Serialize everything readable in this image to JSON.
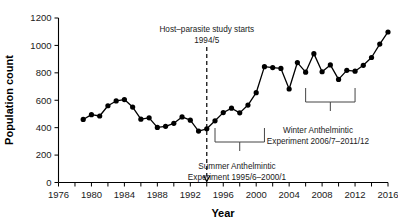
{
  "chart_data": {
    "type": "line",
    "title": "",
    "xlabel": "Year",
    "ylabel": "Population count",
    "xlim": [
      1976,
      2016
    ],
    "ylim": [
      0,
      1200
    ],
    "grid": false,
    "legend": "none",
    "xticks": [
      "1976",
      "1980",
      "1984",
      "1988",
      "1992",
      "1996",
      "2000",
      "2004",
      "2008",
      "2012",
      "2016"
    ],
    "yticks": [
      "0",
      "200",
      "400",
      "600",
      "800",
      "1000",
      "1200"
    ],
    "series": [
      {
        "name": "Population count",
        "marker": "filled-circle",
        "color": "#000000",
        "x": [
          1979,
          1980,
          1981,
          1982,
          1983,
          1984,
          1985,
          1986,
          1987,
          1988,
          1989,
          1990,
          1991,
          1992,
          1993,
          1994,
          1995,
          1996,
          1997,
          1998,
          1999,
          2000,
          2001,
          2002,
          2003,
          2004,
          2005,
          2006,
          2007,
          2008,
          2009,
          2010,
          2011,
          2012,
          2013,
          2014,
          2015,
          2016
        ],
        "values": [
          460,
          495,
          485,
          560,
          595,
          605,
          550,
          462,
          472,
          402,
          410,
          432,
          478,
          455,
          375,
          392,
          450,
          510,
          542,
          508,
          565,
          655,
          845,
          838,
          832,
          682,
          875,
          805,
          940,
          808,
          858,
          752,
          818,
          812,
          855,
          912,
          1010,
          1098
        ]
      }
    ],
    "annotations": [
      {
        "name": "study-start",
        "line1": "Host–parasite study starts",
        "line2": "1994/5",
        "marker_type": "dashed-vertical-arrow",
        "x_value": 1994
      },
      {
        "name": "summer-experiment",
        "line1": "Summer Anthelmintic",
        "line2": "Experiment 1995/6–2000/1",
        "marker_type": "bracket",
        "x_start": 1995,
        "x_end": 2001
      },
      {
        "name": "winter-experiment",
        "line1": "Winter Anthelmintic",
        "line2": "Experiment 2006/7–2011/12",
        "marker_type": "bracket",
        "x_start": 2006,
        "x_end": 2012
      }
    ]
  },
  "axes": {
    "x_label": "Year",
    "y_label": "Population count"
  },
  "colors": {
    "series": "#000000",
    "axis": "#000000",
    "annotation": "#444444"
  }
}
